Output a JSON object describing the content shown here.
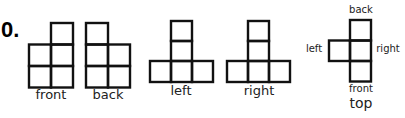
{
  "problem": {
    "number": "0."
  },
  "views": [
    {
      "id": "front",
      "label": "front"
    },
    {
      "id": "back",
      "label": "back"
    },
    {
      "id": "left",
      "label": "left"
    },
    {
      "id": "right",
      "label": "right"
    },
    {
      "id": "top",
      "label": "top",
      "side_labels": {
        "back": "back",
        "left": "left",
        "right": "right",
        "front": "front"
      }
    }
  ],
  "style": {
    "stroke": "#111111",
    "background": "#ffffff"
  }
}
